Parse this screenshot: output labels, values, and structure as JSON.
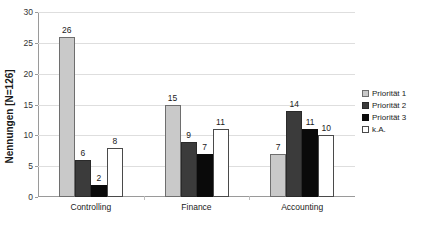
{
  "chart_data": {
    "type": "bar",
    "title": "",
    "xlabel": "",
    "ylabel": "Nennungen [N=126]",
    "categories": [
      "Controlling",
      "Finance",
      "Accounting"
    ],
    "series": [
      {
        "name": "Priorität 1",
        "values": [
          26,
          15,
          7
        ],
        "color": "#c9c9c9"
      },
      {
        "name": "Priorität 2",
        "values": [
          6,
          9,
          14
        ],
        "color": "#3b3b3b"
      },
      {
        "name": "Priorität 3",
        "values": [
          2,
          7,
          11
        ],
        "color": "#0a0a0a"
      },
      {
        "name": "k.A.",
        "values": [
          8,
          11,
          10
        ],
        "color": "#ffffff"
      }
    ],
    "ylim": [
      0,
      30
    ],
    "yticks": [
      0,
      5,
      10,
      15,
      20,
      25,
      30
    ],
    "ytick_labels": [
      "0",
      "5",
      "10",
      "15",
      "20",
      "25",
      "30"
    ],
    "grid": true,
    "data_labels": true,
    "legend_position": "right"
  },
  "legend": {
    "items": [
      {
        "label": "Priorität 1"
      },
      {
        "label": "Priorität 2"
      },
      {
        "label": "Priorität 3"
      },
      {
        "label": "k.A."
      }
    ]
  }
}
